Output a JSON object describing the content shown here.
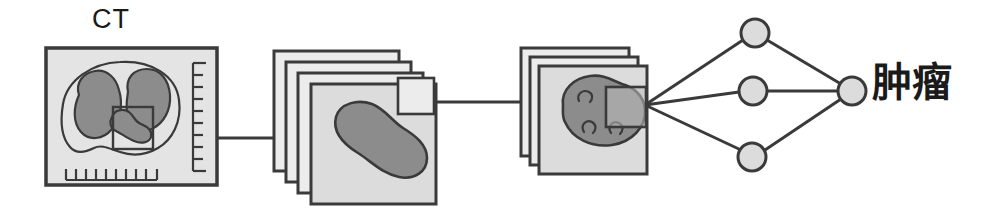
{
  "figure": {
    "type": "pipeline-diagram",
    "background_color": "#ffffff",
    "stroke_color": "#3a3a3a",
    "panel_fill": "#e2e2e2",
    "panel_fill_light": "#ececec",
    "organ_fill": "#8c8c8c",
    "node_fill": "#dcdcdc",
    "labels": {
      "ct_label": "CT",
      "output_label": "肿瘤"
    }
  },
  "stages": [
    {
      "id": "ct-scan",
      "name": "ct-scan-panel",
      "label": "CT",
      "description": "Axial CT slice with lungs, mediastinal lesion and rulers",
      "roi_box": true,
      "rulers": {
        "bottom_ticks": 10,
        "right_ticks": 9
      }
    },
    {
      "id": "slice-stack",
      "name": "slice-stack-panel",
      "label": "",
      "description": "Stack of 4 segmented lesion slices with ROI square",
      "panel_count": 4,
      "roi_box": true
    },
    {
      "id": "lesion-stack",
      "name": "lesion-stack-panel",
      "label": "",
      "description": "Stack of 3 texture-feature lesion slices with ROI square",
      "panel_count": 3,
      "roi_box": true
    },
    {
      "id": "neural-network",
      "name": "neural-network",
      "label": "",
      "description": "Fully connected classifier with 3 hidden nodes and 1 output node",
      "hidden_nodes": 3,
      "output_nodes": 1
    }
  ],
  "network": {
    "hidden_nodes": [
      {
        "name": "hidden-node-1",
        "cx": 755,
        "cy": 33,
        "r": 14
      },
      {
        "name": "hidden-node-2",
        "cx": 753,
        "cy": 91,
        "r": 14
      },
      {
        "name": "hidden-node-3",
        "cx": 752,
        "cy": 157,
        "r": 14
      }
    ],
    "output_node": {
      "name": "output-node",
      "cx": 852,
      "cy": 91,
      "r": 14
    }
  }
}
